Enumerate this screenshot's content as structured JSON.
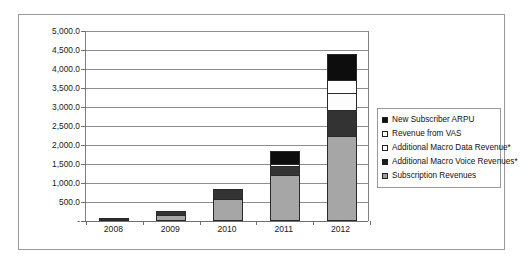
{
  "chart_data": {
    "type": "bar",
    "subtype": "stacked-column",
    "title": "",
    "xlabel": "",
    "ylabel": "",
    "categories": [
      "2008",
      "2009",
      "2010",
      "2011",
      "2012"
    ],
    "ylim": [
      0,
      5000
    ],
    "ytick_values": [
      0,
      500,
      1000,
      1500,
      2000,
      2500,
      3000,
      3500,
      4000,
      4500,
      5000
    ],
    "ytick_labels": [
      "-",
      "500.0",
      "1,000.0",
      "1,500.0",
      "2,000.0",
      "2,500.0",
      "3,000.0",
      "3,500.0",
      "4,000.0",
      "4,500.0",
      "5,000.0"
    ],
    "grid": true,
    "legend_position": "right",
    "series": [
      {
        "name": "Subscription Revenues",
        "color": "#a6a6a6",
        "values": [
          30,
          170,
          570,
          1220,
          2250
        ]
      },
      {
        "name": "Additional Macro Voice Revenues*",
        "color": "#333333",
        "values": [
          25,
          85,
          280,
          220,
          680
        ]
      },
      {
        "name": "Additional Macro Data Revenue*",
        "color": "#fdfdfd",
        "values": [
          0,
          0,
          0,
          60,
          450
        ]
      },
      {
        "name": "Revenue from VAS",
        "color": "#ffffff",
        "values": [
          0,
          0,
          0,
          0,
          340
        ]
      },
      {
        "name": "New Subscriber ARPU",
        "color": "#0d0d0d",
        "values": [
          0,
          0,
          0,
          350,
          680
        ]
      }
    ],
    "totals": [
      55,
      255,
      850,
      1850,
      4400
    ]
  },
  "legend": {
    "items": [
      {
        "label": "New Subscriber ARPU",
        "swatch": "arpu"
      },
      {
        "label": "Revenue from VAS",
        "swatch": "vas"
      },
      {
        "label": "Additional Macro Data Revenue*",
        "swatch": "data"
      },
      {
        "label": "Additional Macro Voice Revenues*",
        "swatch": "voice"
      },
      {
        "label": "Subscription Revenues",
        "swatch": "sub"
      }
    ]
  }
}
